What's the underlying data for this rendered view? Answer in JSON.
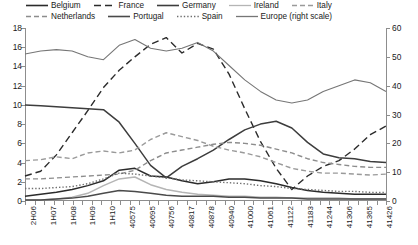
{
  "legend": {
    "rows": [
      [
        {
          "label": "Belgium",
          "style": "solid",
          "color": "#2b2b2b",
          "width": 1.6
        },
        {
          "label": "France",
          "style": "dash-long",
          "color": "#2b2b2b",
          "width": 1.5
        },
        {
          "label": "Germany",
          "style": "solid",
          "color": "#3d3d3d",
          "width": 1.6
        },
        {
          "label": "Ireland",
          "style": "solid",
          "color": "#b5b5b5",
          "width": 1.3
        },
        {
          "label": "Italy",
          "style": "dash",
          "color": "#9a9a9a",
          "width": 1.4
        }
      ],
      [
        {
          "label": "Netherlands",
          "style": "dash",
          "color": "#8d8d8d",
          "width": 1.4
        },
        {
          "label": "Portugal",
          "style": "solid",
          "color": "#4a4a4a",
          "width": 1.6
        },
        {
          "label": "Spain",
          "style": "dot",
          "color": "#6f6f6f",
          "width": 1.4
        },
        {
          "label": "Europe (right scale)",
          "style": "solid",
          "color": "#767676",
          "width": 1.3
        }
      ]
    ]
  },
  "axes": {
    "left": {
      "min": 0,
      "max": 18,
      "step": 2,
      "ticks": [
        "0",
        "2",
        "4",
        "6",
        "8",
        "10",
        "12",
        "14",
        "16",
        "18"
      ]
    },
    "right": {
      "min": 0,
      "max": 60,
      "step": 10,
      "ticks": [
        "0",
        "10",
        "20",
        "30",
        "40",
        "50",
        "60"
      ]
    },
    "x_labels": [
      "2H06",
      "1H07",
      "1H08",
      "1H09",
      "1H10",
      "40575",
      "40695",
      "40756",
      "40817",
      "40878",
      "40940",
      "41000",
      "41061",
      "41122",
      "41183",
      "41244",
      "41306",
      "41365",
      "41426"
    ]
  },
  "chart_data": {
    "type": "line",
    "title": "",
    "xlabel": "",
    "ylabel": "",
    "ylim": [
      0,
      18
    ],
    "y2lim": [
      0,
      60
    ],
    "grid": false,
    "legend_position": "top",
    "x": [
      "2H06",
      "1H07",
      "2H07",
      "1H08",
      "2H08",
      "1H09",
      "2H09",
      "1H10",
      "2H10",
      "40575",
      "40635",
      "40695",
      "40756",
      "40817",
      "40878",
      "40940",
      "41000",
      "41061",
      "41122",
      "41183",
      "41244",
      "41306",
      "41365",
      "41426"
    ],
    "x_tick_labels": [
      "2H06",
      "1H07",
      "1H08",
      "1H09",
      "1H10",
      "40575",
      "40695",
      "40756",
      "40817",
      "40878",
      "40940",
      "41000",
      "41061",
      "41122",
      "41183",
      "41244",
      "41306",
      "41365",
      "41426"
    ],
    "series": [
      {
        "name": "Belgium",
        "axis": "left",
        "style": "solid",
        "color": "#2b2b2b",
        "values": [
          0.5,
          0.7,
          0.9,
          1.2,
          1.6,
          2.1,
          3.2,
          3.4,
          2.6,
          2.5,
          2.1,
          1.8,
          2.0,
          2.3,
          2.3,
          2.1,
          1.8,
          1.4,
          1.1,
          0.9,
          0.8,
          0.7,
          0.7,
          0.7
        ]
      },
      {
        "name": "France",
        "axis": "left",
        "style": "dash-long",
        "color": "#2b2b2b",
        "values": [
          2.6,
          3.1,
          4.8,
          7.1,
          9.4,
          11.8,
          13.6,
          15.0,
          16.3,
          17.0,
          15.4,
          16.4,
          15.8,
          13.2,
          9.6,
          6.2,
          3.4,
          1.2,
          2.6,
          3.6,
          4.2,
          5.4,
          6.9,
          7.8
        ]
      },
      {
        "name": "Germany",
        "axis": "left",
        "style": "solid",
        "color": "#3d3d3d",
        "values": [
          10.0,
          9.9,
          9.8,
          9.7,
          9.6,
          9.5,
          8.2,
          6.0,
          3.7,
          2.4,
          3.6,
          4.4,
          5.3,
          6.4,
          7.4,
          8.0,
          8.3,
          7.6,
          6.1,
          4.9,
          4.5,
          4.4,
          4.1,
          4.0
        ]
      },
      {
        "name": "Ireland",
        "axis": "left",
        "style": "solid",
        "color": "#b5b5b5",
        "values": [
          0.1,
          0.1,
          0.2,
          0.4,
          0.8,
          1.6,
          2.3,
          2.5,
          1.7,
          1.2,
          0.9,
          0.7,
          0.6,
          0.5,
          0.5,
          0.4,
          0.4,
          0.3,
          0.3,
          0.3,
          0.3,
          0.2,
          0.2,
          0.2
        ]
      },
      {
        "name": "Italy",
        "axis": "left",
        "style": "dash",
        "color": "#9a9a9a",
        "values": [
          4.2,
          4.3,
          4.6,
          4.4,
          5.0,
          5.2,
          5.0,
          5.3,
          6.4,
          7.1,
          6.7,
          6.3,
          5.7,
          5.3,
          5.0,
          4.6,
          4.0,
          3.4,
          3.1,
          2.9,
          2.9,
          2.8,
          2.7,
          2.8
        ]
      },
      {
        "name": "Netherlands",
        "axis": "left",
        "style": "dash",
        "color": "#8d8d8d",
        "values": [
          2.3,
          2.3,
          2.4,
          2.5,
          2.6,
          2.7,
          2.8,
          3.2,
          4.2,
          5.0,
          5.3,
          5.6,
          5.9,
          6.1,
          6.0,
          5.8,
          5.4,
          5.0,
          4.4,
          4.0,
          3.8,
          3.6,
          3.5,
          3.5
        ]
      },
      {
        "name": "Portugal",
        "axis": "left",
        "style": "solid",
        "color": "#4a4a4a",
        "values": [
          0.1,
          0.1,
          0.2,
          0.3,
          0.5,
          0.8,
          1.1,
          1.0,
          0.8,
          0.6,
          0.5,
          0.5,
          0.5,
          0.4,
          0.4,
          0.3,
          0.3,
          0.3,
          0.2,
          0.2,
          0.2,
          0.2,
          0.2,
          0.2
        ]
      },
      {
        "name": "Spain",
        "axis": "left",
        "style": "dot",
        "color": "#6f6f6f",
        "values": [
          1.3,
          1.3,
          1.4,
          1.5,
          1.8,
          2.3,
          2.9,
          2.8,
          2.6,
          2.4,
          2.2,
          2.1,
          2.0,
          1.9,
          1.8,
          1.6,
          1.5,
          1.3,
          1.2,
          1.1,
          1.0,
          1.0,
          0.9,
          0.9
        ]
      },
      {
        "name": "Europe (right scale)",
        "axis": "right",
        "style": "solid",
        "color": "#767676",
        "values": [
          51,
          52,
          52.5,
          52,
          50,
          49,
          54,
          56,
          53,
          52,
          53,
          55,
          52,
          47,
          42,
          38,
          35,
          34,
          35,
          38,
          40,
          42,
          41,
          38
        ]
      }
    ]
  }
}
